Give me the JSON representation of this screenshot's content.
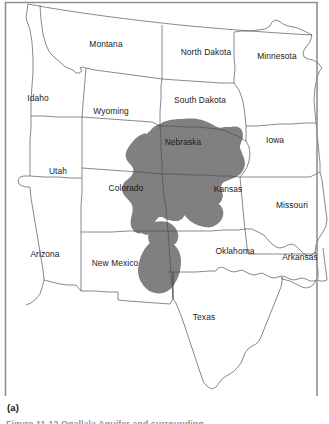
{
  "figure": {
    "subfigure_label": "(a)",
    "caption_partial": "Figure 11-12  Ogallala Aquifer and surrounding",
    "colors": {
      "aquifer_fill": "#808080",
      "state_outline": "#4d4d4d",
      "frame": "#7a7a7a",
      "background": "#ffffff",
      "label_text": "#1a1a1a"
    }
  },
  "map": {
    "title": "",
    "aquifer_name": "Ogallala Aquifer",
    "states": [
      {
        "name": "Montana",
        "label_x": 106,
        "label_y": 45
      },
      {
        "name": "North Dakota",
        "label_x": 206,
        "label_y": 53
      },
      {
        "name": "Minnesota",
        "label_x": 277,
        "label_y": 57
      },
      {
        "name": "Idaho",
        "label_x": 38,
        "label_y": 99
      },
      {
        "name": "Wyoming",
        "label_x": 111,
        "label_y": 112
      },
      {
        "name": "South Dakota",
        "label_x": 200,
        "label_y": 101
      },
      {
        "name": "Nebraska",
        "label_x": 183,
        "label_y": 143
      },
      {
        "name": "Iowa",
        "label_x": 275,
        "label_y": 141
      },
      {
        "name": "Utah",
        "label_x": 58,
        "label_y": 172
      },
      {
        "name": "Colorado",
        "label_x": 126,
        "label_y": 189
      },
      {
        "name": "Kansas",
        "label_x": 228,
        "label_y": 190
      },
      {
        "name": "Missouri",
        "label_x": 292,
        "label_y": 206
      },
      {
        "name": "Arizona",
        "label_x": 45,
        "label_y": 255
      },
      {
        "name": "New Mexico",
        "label_x": 115,
        "label_y": 264
      },
      {
        "name": "Oklahoma",
        "label_x": 235,
        "label_y": 252
      },
      {
        "name": "Arkansas",
        "label_x": 300,
        "label_y": 258
      },
      {
        "name": "Texas",
        "label_x": 204,
        "label_y": 318
      }
    ]
  }
}
